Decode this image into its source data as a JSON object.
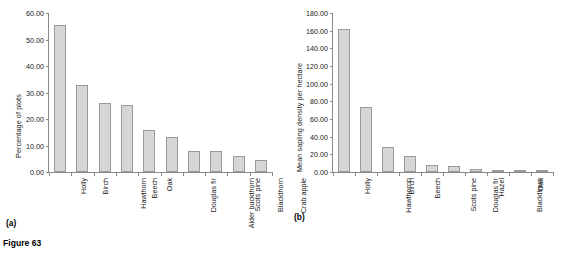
{
  "figure": {
    "caption": "Figure 63",
    "panel_a_label": "(a)",
    "panel_b_label": "(b)"
  },
  "colors": {
    "bar_fill": "#d6d6d6",
    "bar_border": "#9a9a9a",
    "axis": "#8a8a8a",
    "text": "#1a1a1a",
    "background": "#ffffff"
  },
  "chart_data": [
    {
      "type": "bar",
      "panel": "(a)",
      "title": "",
      "xlabel": "",
      "ylabel": "Percentage of plots",
      "ylim": [
        0,
        60
      ],
      "ytick_labels": [
        "0.00",
        "10.00",
        "20.00",
        "30.00",
        "40.00",
        "50.00",
        "60.00"
      ],
      "ytick_values": [
        0,
        10,
        20,
        30,
        40,
        50,
        60
      ],
      "grid": false,
      "legend": false,
      "categories": [
        "Holly",
        "Birch",
        "Hawthorn",
        "Beech",
        "Oak",
        "Douglas fir",
        "Alder buckthorn",
        "Scots pine",
        "Blackthorn",
        "Crab apple"
      ],
      "values": [
        55.4,
        32.9,
        26.2,
        25.3,
        15.7,
        13.3,
        8.1,
        7.9,
        6.1,
        4.4
      ]
    },
    {
      "type": "bar",
      "panel": "(b)",
      "title": "",
      "xlabel": "",
      "ylabel": "Mean sapling density per hectare",
      "ylim": [
        0,
        180
      ],
      "ytick_labels": [
        "0.00",
        "20.00",
        "40.00",
        "60.00",
        "80.00",
        "100.00",
        "120.00",
        "140.00",
        "160.00",
        "180.00"
      ],
      "ytick_values": [
        0,
        20,
        40,
        60,
        80,
        100,
        120,
        140,
        160,
        180
      ],
      "grid": false,
      "legend": false,
      "categories": [
        "Holly",
        "Hawthornh",
        "Birch",
        "Beech",
        "Scots pine",
        "Douglas fir",
        "Hazel",
        "Blackthorn",
        "Oak",
        "Norway Spruce"
      ],
      "values": [
        161.5,
        73.3,
        28.6,
        18.3,
        7.7,
        7.1,
        3.7,
        1.4,
        1.3,
        1.2
      ]
    }
  ]
}
